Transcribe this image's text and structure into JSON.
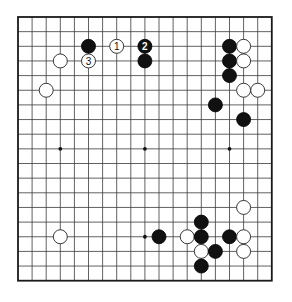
{
  "board": {
    "size": 19,
    "origin_x": 18,
    "origin_y": 17,
    "step_x": 14.1,
    "step_y": 14.65,
    "stone_radius": 7,
    "hoshi": [
      [
        3,
        9
      ],
      [
        9,
        9
      ],
      [
        15,
        9
      ],
      [
        9,
        15
      ]
    ],
    "colors": {
      "black": "#111111",
      "white": "#ffffff",
      "line": "#3a3a3a"
    }
  },
  "stones": [
    {
      "col": 5,
      "row": 2,
      "color": "black",
      "label": ""
    },
    {
      "col": 7,
      "row": 2,
      "color": "white",
      "label": "1"
    },
    {
      "col": 9,
      "row": 2,
      "color": "black",
      "label": "2"
    },
    {
      "col": 9,
      "row": 3,
      "color": "black",
      "label": ""
    },
    {
      "col": 5,
      "row": 3,
      "color": "white",
      "label": "3"
    },
    {
      "col": 3,
      "row": 3,
      "color": "white",
      "label": ""
    },
    {
      "col": 2,
      "row": 5,
      "color": "white",
      "label": ""
    },
    {
      "col": 15,
      "row": 2,
      "color": "black",
      "label": ""
    },
    {
      "col": 15,
      "row": 3,
      "color": "black",
      "label": ""
    },
    {
      "col": 15,
      "row": 4,
      "color": "black",
      "label": ""
    },
    {
      "col": 16,
      "row": 2,
      "color": "white",
      "label": ""
    },
    {
      "col": 16,
      "row": 3,
      "color": "white",
      "label": ""
    },
    {
      "col": 16,
      "row": 5,
      "color": "white",
      "label": ""
    },
    {
      "col": 17,
      "row": 5,
      "color": "white",
      "label": ""
    },
    {
      "col": 14,
      "row": 6,
      "color": "black",
      "label": ""
    },
    {
      "col": 16,
      "row": 7,
      "color": "black",
      "label": ""
    },
    {
      "col": 16,
      "row": 13,
      "color": "white",
      "label": ""
    },
    {
      "col": 13,
      "row": 14,
      "color": "black",
      "label": ""
    },
    {
      "col": 10,
      "row": 15,
      "color": "black",
      "label": ""
    },
    {
      "col": 12,
      "row": 15,
      "color": "white",
      "label": ""
    },
    {
      "col": 13,
      "row": 15,
      "color": "black",
      "label": ""
    },
    {
      "col": 15,
      "row": 15,
      "color": "black",
      "label": ""
    },
    {
      "col": 16,
      "row": 15,
      "color": "white",
      "label": ""
    },
    {
      "col": 13,
      "row": 16,
      "color": "white",
      "label": ""
    },
    {
      "col": 14,
      "row": 16,
      "color": "black",
      "label": ""
    },
    {
      "col": 16,
      "row": 16,
      "color": "white",
      "label": ""
    },
    {
      "col": 13,
      "row": 17,
      "color": "black",
      "label": ""
    },
    {
      "col": 3,
      "row": 15,
      "color": "white",
      "label": ""
    }
  ]
}
